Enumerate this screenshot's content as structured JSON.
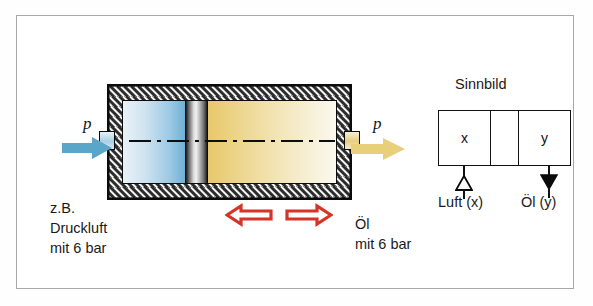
{
  "cylinder": {
    "inlet_pressure_label": "p",
    "outlet_pressure_label": "p",
    "inlet_arrow_color": "#5aa6c8",
    "outlet_arrow_color": "#e8d07a",
    "air_chamber_color": "#9ec9e4",
    "oil_chamber_color": "#eed892",
    "piston_color": "#c9c9c9",
    "internal_arrow_color": "#d63427",
    "wall_color": "#2c2c2c"
  },
  "labels": {
    "left_line1": "z.B.",
    "left_line2": "Druckluft",
    "left_line3": "mit 6 bar",
    "right_line1": "Öl",
    "right_line2": "mit 6 bar"
  },
  "symbol": {
    "title": "Sinnbild",
    "cell_x": "x",
    "cell_mid": "",
    "cell_y": "y",
    "port_air_label": "Luft (x)",
    "port_oil_label": "Öl (y)",
    "port_air_style": "hollow-triangle",
    "port_oil_style": "filled-triangle"
  },
  "frame": {
    "border_color": "#a8a8a8",
    "background": "#ffffff"
  }
}
